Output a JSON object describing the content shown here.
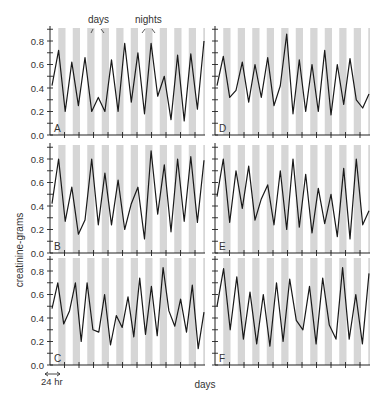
{
  "chart_data": {
    "type": "line",
    "figure_annotations": {
      "days_label": "days",
      "nights_label": "nights",
      "scale_label": "24 hr",
      "ylabel": "creatinine-grams",
      "xlabel": "days"
    },
    "shading": {
      "nights_color": "#d6d6d6",
      "days_color": "#ffffff"
    },
    "line_color": "#1a1a1a",
    "yticks": [
      "0.0",
      "0.2",
      "0.4",
      "0.6",
      "0.8"
    ],
    "ylim": [
      0,
      0.9
    ],
    "x_unit": "half-day (12 hr) samples",
    "n_days": 11,
    "panels": [
      {
        "name": "A",
        "values": [
          0.42,
          0.72,
          0.2,
          0.62,
          0.25,
          0.66,
          0.2,
          0.32,
          0.2,
          0.64,
          0.2,
          0.78,
          0.28,
          0.7,
          0.18,
          0.78,
          0.33,
          0.5,
          0.13,
          0.68,
          0.12,
          0.69,
          0.22,
          0.8
        ]
      },
      {
        "name": "B",
        "values": [
          0.42,
          0.8,
          0.27,
          0.56,
          0.16,
          0.28,
          0.8,
          0.24,
          0.68,
          0.24,
          0.62,
          0.2,
          0.42,
          0.56,
          0.12,
          0.87,
          0.33,
          0.75,
          0.18,
          0.8,
          0.27,
          0.82,
          0.26,
          0.79
        ]
      },
      {
        "name": "C",
        "values": [
          0.48,
          0.7,
          0.35,
          0.46,
          0.7,
          0.2,
          0.7,
          0.3,
          0.28,
          0.6,
          0.17,
          0.42,
          0.32,
          0.58,
          0.24,
          0.74,
          0.26,
          0.67,
          0.25,
          0.83,
          0.46,
          0.33,
          0.56,
          0.28,
          0.68,
          0.14,
          0.45
        ]
      },
      {
        "name": "D",
        "values": [
          0.42,
          0.67,
          0.32,
          0.38,
          0.62,
          0.28,
          0.6,
          0.32,
          0.66,
          0.25,
          0.42,
          0.86,
          0.18,
          0.64,
          0.2,
          0.6,
          0.2,
          0.72,
          0.17,
          0.6,
          0.26,
          0.65,
          0.3,
          0.23,
          0.35
        ]
      },
      {
        "name": "E",
        "values": [
          0.48,
          0.8,
          0.26,
          0.7,
          0.38,
          0.74,
          0.28,
          0.46,
          0.58,
          0.24,
          0.7,
          0.2,
          0.8,
          0.22,
          0.67,
          0.17,
          0.55,
          0.25,
          0.5,
          0.14,
          0.72,
          0.12,
          0.8,
          0.24,
          0.36
        ]
      },
      {
        "name": "F",
        "values": [
          0.5,
          0.82,
          0.3,
          0.75,
          0.22,
          0.62,
          0.18,
          0.6,
          0.16,
          0.7,
          0.2,
          0.73,
          0.38,
          0.3,
          0.67,
          0.18,
          0.74,
          0.34,
          0.22,
          0.83,
          0.22,
          0.6,
          0.18,
          0.78
        ]
      }
    ]
  }
}
